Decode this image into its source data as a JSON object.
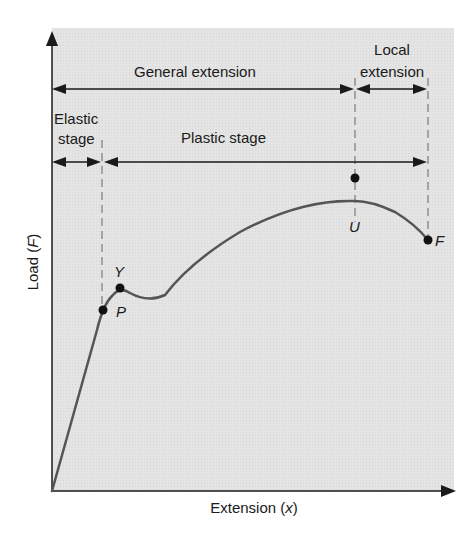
{
  "diagram": {
    "axes": {
      "y_label": "Load (F)",
      "y_label_text": "Load (",
      "y_label_var": "F",
      "y_label_close": ")",
      "x_label_text": "Extension (",
      "x_label_var": "x",
      "x_label_close": ")"
    },
    "regions": {
      "general_extension": "General extension",
      "local_extension_line1": "Local",
      "local_extension_line2": "extension",
      "elastic_stage_line1": "Elastic",
      "elastic_stage_line2": "stage",
      "plastic_stage": "Plastic stage"
    },
    "points": [
      {
        "id": "P",
        "label": "P",
        "meaning": "limit of proportionality"
      },
      {
        "id": "Y",
        "label": "Y",
        "meaning": "yield point"
      },
      {
        "id": "U",
        "label": "U",
        "meaning": "ultimate load"
      },
      {
        "id": "F",
        "label": "F",
        "meaning": "fracture"
      }
    ],
    "colors": {
      "background": "#e3e3e3",
      "curve": "#555555",
      "axis": "#1a1a1a",
      "point": "#111111",
      "dashed": "#666666"
    }
  }
}
